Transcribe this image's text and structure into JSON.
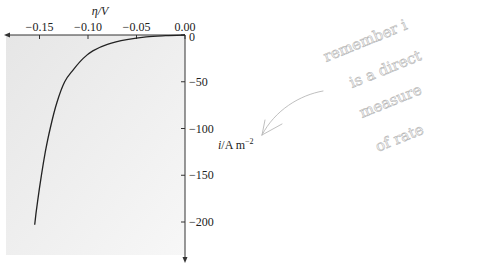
{
  "chart_data": {
    "type": "line",
    "title": "",
    "xlabel": "η/V",
    "ylabel": "i/A m⁻²",
    "xlim": [
      -0.16,
      0.0
    ],
    "ylim": [
      -225,
      0
    ],
    "x_ticks": [
      "−0.15",
      "−0.10",
      "−0.05",
      "0.00"
    ],
    "x_tick_values": [
      -0.15,
      -0.1,
      -0.05,
      0.0
    ],
    "y_ticks": [
      "0",
      "−50",
      "−100",
      "−150",
      "−200"
    ],
    "y_tick_values": [
      0,
      -50,
      -100,
      -150,
      -200
    ],
    "grid": false,
    "legend": null,
    "series": [
      {
        "name": "current density vs overpotential",
        "x": [
          0.0,
          -0.02,
          -0.04,
          -0.06,
          -0.08,
          -0.095,
          -0.105,
          -0.115,
          -0.124,
          -0.132,
          -0.139,
          -0.144,
          -0.148,
          -0.152,
          -0.155
        ],
        "y": [
          0,
          -0.7,
          -2,
          -5,
          -10,
          -17,
          -25,
          -37,
          -50,
          -72,
          -100,
          -125,
          -150,
          -178,
          -203
        ]
      }
    ],
    "annotations": [
      {
        "type": "handwritten-note",
        "text": "remember i is a direct measure of rate"
      },
      {
        "type": "handwritten-arrow",
        "points_to": "i/A m⁻² axis label"
      }
    ],
    "background": "light gray gradient fill in plot area"
  },
  "labels": {
    "x_axis": "η/V",
    "y_axis_italic": "i",
    "y_axis_rest": "/A m",
    "y_axis_sup": "−2",
    "note_lines": [
      "remember i",
      "is a direct",
      "measure",
      "of rate"
    ]
  }
}
